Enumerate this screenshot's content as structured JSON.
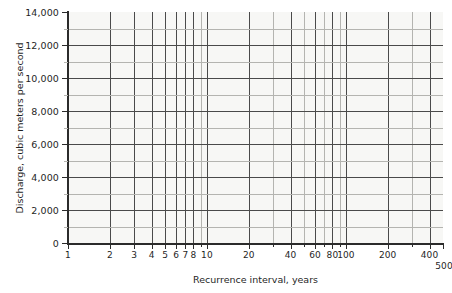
{
  "chart_data": {
    "type": "line",
    "title": "",
    "subtitle": "",
    "xlabel": "Recurrence interval, years",
    "ylabel": "Discharge, cubic meters per second",
    "xscale": "log",
    "yscale": "linear",
    "xlim": [
      1,
      500
    ],
    "ylim": [
      0,
      14000
    ],
    "grid": true,
    "legend": null,
    "series": [],
    "annotations": [],
    "x_major_ticks": [
      1,
      2,
      3,
      4,
      5,
      6,
      7,
      8,
      9,
      10,
      20,
      30,
      40,
      50,
      60,
      70,
      80,
      90,
      100,
      200,
      300,
      400,
      500
    ],
    "x_tick_labels": [
      {
        "value": 1,
        "label": "1"
      },
      {
        "value": 2,
        "label": "2"
      },
      {
        "value": 3,
        "label": "3"
      },
      {
        "value": 4,
        "label": "4"
      },
      {
        "value": 5,
        "label": "5"
      },
      {
        "value": 6,
        "label": "6"
      },
      {
        "value": 7,
        "label": "7"
      },
      {
        "value": 8,
        "label": "8"
      },
      {
        "value": 10,
        "label": "10"
      },
      {
        "value": 20,
        "label": "20"
      },
      {
        "value": 40,
        "label": "40"
      },
      {
        "value": 60,
        "label": "60"
      },
      {
        "value": 80,
        "label": "80"
      },
      {
        "value": 100,
        "label": "100"
      },
      {
        "value": 200,
        "label": "200"
      },
      {
        "value": 400,
        "label": "400"
      },
      {
        "value": 500,
        "label": "500"
      }
    ],
    "y_major_ticks": [
      0,
      2000,
      4000,
      6000,
      8000,
      10000,
      12000,
      14000
    ],
    "y_minor_ticks": [
      1000,
      3000,
      5000,
      7000,
      9000,
      11000,
      13000
    ],
    "y_tick_labels": [
      {
        "value": 0,
        "label": "0"
      },
      {
        "value": 2000,
        "label": "2,000"
      },
      {
        "value": 4000,
        "label": "4,000"
      },
      {
        "value": 6000,
        "label": "6,000"
      },
      {
        "value": 8000,
        "label": "8,000"
      },
      {
        "value": 10000,
        "label": "10,000"
      },
      {
        "value": 12000,
        "label": "12,000"
      },
      {
        "value": 14000,
        "label": "14,000"
      }
    ]
  },
  "style": {
    "background": "#ffffff",
    "plot_background": "#f7f7f5",
    "axis_color": "#2b2b2b",
    "grid_major_color": "#4a4a4a",
    "grid_minor_color": "#b4b4b0",
    "text_color": "#1f1f1f"
  },
  "geometry": {
    "plot_left": 68,
    "plot_right": 443,
    "plot_top": 12,
    "plot_bottom": 243
  }
}
